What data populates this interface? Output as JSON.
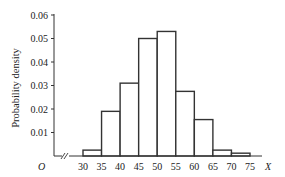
{
  "chart_data": {
    "type": "bar",
    "subtype": "histogram",
    "title": "",
    "xlabel": "X",
    "ylabel": "Probability density",
    "origin_label": "O",
    "axis_break": true,
    "bin_edges": [
      30,
      35,
      40,
      45,
      50,
      55,
      60,
      65,
      70,
      75
    ],
    "categories": [
      "30-35",
      "35-40",
      "40-45",
      "45-50",
      "50-55",
      "55-60",
      "60-65",
      "65-70",
      "70-75"
    ],
    "values": [
      0.0025,
      0.019,
      0.031,
      0.05,
      0.053,
      0.0275,
      0.0155,
      0.0025,
      0.0012
    ],
    "x_ticks": [
      "30",
      "35",
      "40",
      "45",
      "50",
      "55",
      "60",
      "65",
      "70",
      "75"
    ],
    "y_ticks": [
      "0.01",
      "0.02",
      "0.03",
      "0.04",
      "0.05",
      "0.06"
    ],
    "ylim": [
      0,
      0.06
    ],
    "xlim": [
      30,
      75
    ],
    "grid": false,
    "legend": null,
    "colors": {
      "bar_fill": "#ffffff",
      "bar_edge": "#333333",
      "axis": "#333333"
    }
  }
}
